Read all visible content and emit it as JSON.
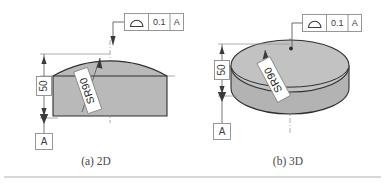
{
  "figure": {
    "background_color": "#ffffff",
    "part_fill_color": "#b9b9b9",
    "part_outline_color": "#2e2e2e",
    "annotation_color": "#3d3d3d"
  },
  "panels": [
    {
      "id": "panel-2d",
      "caption": "(a) 2D",
      "feature_control_frame": {
        "symbol_name": "profile-of-a-surface-icon",
        "symbol_label": "profile of a surface",
        "tolerance": "0.1",
        "datum": "A"
      },
      "dimension": {
        "value": "50",
        "orientation": "vertical"
      },
      "radius_callout": "SR90",
      "datum_feature": "A"
    },
    {
      "id": "panel-3d",
      "caption": "(b) 3D",
      "feature_control_frame": {
        "symbol_name": "profile-of-a-surface-icon",
        "symbol_label": "profile of a surface",
        "tolerance": "0.1",
        "datum": "A"
      },
      "dimension": {
        "value": "50",
        "orientation": "vertical"
      },
      "radius_callout": "SR90",
      "datum_feature": "A"
    }
  ]
}
